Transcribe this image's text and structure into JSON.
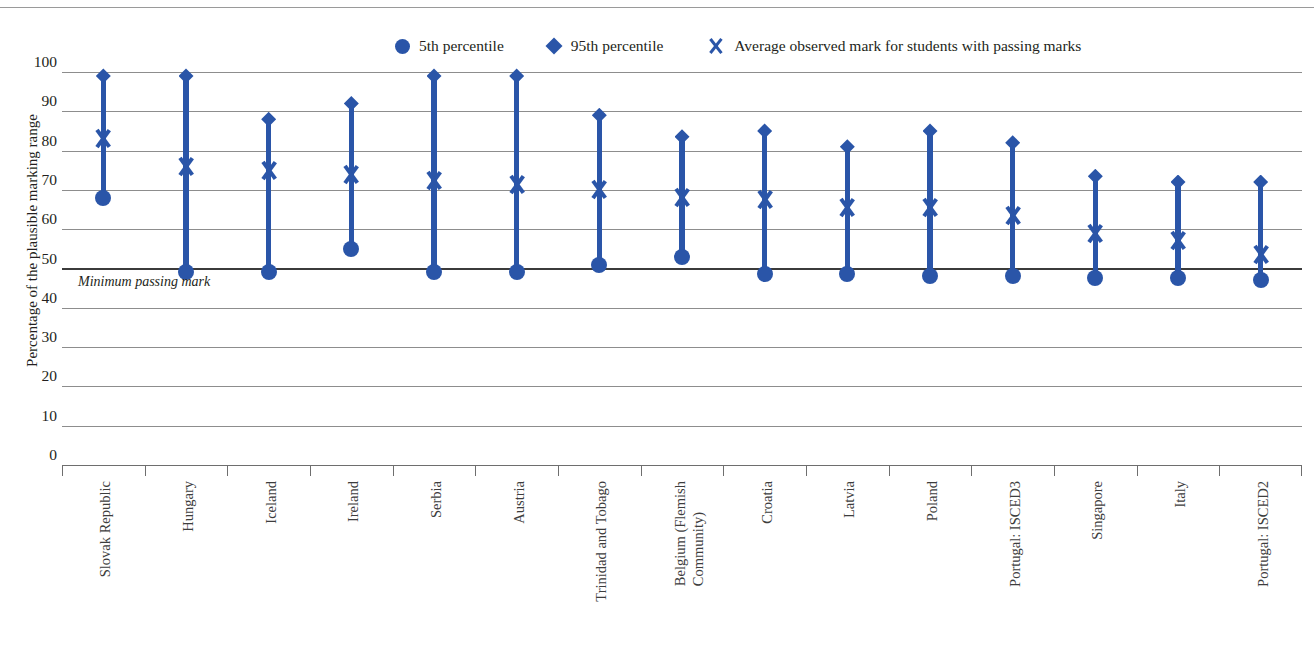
{
  "chart_data": {
    "type": "scatter",
    "title": "",
    "xlabel": "",
    "ylabel": "Percentage of the plausible marking range",
    "ylim": [
      0,
      100
    ],
    "yticks": [
      "100",
      "90",
      "80",
      "70",
      "60",
      "50",
      "40",
      "30",
      "20",
      "10",
      "0"
    ],
    "ytick_values": [
      100,
      90,
      80,
      70,
      60,
      50,
      40,
      30,
      20,
      10,
      0
    ],
    "grid": true,
    "legend_position": "top-center",
    "annotations": [
      {
        "text": "Minimum passing mark",
        "y": 50,
        "style": "italic"
      }
    ],
    "reference_line": {
      "label": "Minimum passing mark",
      "value": 50
    },
    "categories": [
      "Slovak Republic",
      "Hungary",
      "Iceland",
      "Ireland",
      "Serbia",
      "Austria",
      "Trinidad and Tobago",
      "Belgium (Flemish\nCommunity)",
      "Croatia",
      "Latvia",
      "Poland",
      "Portugal: ISCED3",
      "Singapore",
      "Italy",
      "Portugal: ISCED2"
    ],
    "series": [
      {
        "name": "5th percentile",
        "marker": "circle",
        "color": "#2a55a8",
        "values": [
          68,
          49,
          49,
          55,
          49,
          49,
          51,
          53,
          48.5,
          48.5,
          48,
          48,
          47.5,
          47.5,
          47
        ]
      },
      {
        "name": "95th percentile",
        "marker": "diamond",
        "color": "#2a55a8",
        "values": [
          99,
          99,
          88,
          92,
          99,
          99,
          89,
          83.5,
          85,
          81,
          85,
          82,
          73.5,
          72,
          72
        ]
      },
      {
        "name": "Average observed mark for students with passing marks",
        "marker": "x",
        "color": "#2a55a8",
        "values": [
          83,
          76,
          75,
          74,
          72.5,
          71.5,
          70,
          68,
          67.5,
          65.5,
          65.5,
          63.5,
          59,
          57,
          53.5
        ]
      }
    ]
  },
  "legend": {
    "items": [
      {
        "label": "5th percentile",
        "marker": "circle-icon"
      },
      {
        "label": "95th percentile",
        "marker": "diamond-icon"
      },
      {
        "label": "Average observed mark for students with passing marks",
        "marker": "x-icon"
      }
    ]
  },
  "axis": {
    "y_title": "Percentage of the plausible marking range"
  },
  "colors": {
    "marker_blue": "#2a55a8",
    "gridline": "#8d8d8d",
    "passing_line": "#3b3b3b",
    "text": "#231f20"
  }
}
